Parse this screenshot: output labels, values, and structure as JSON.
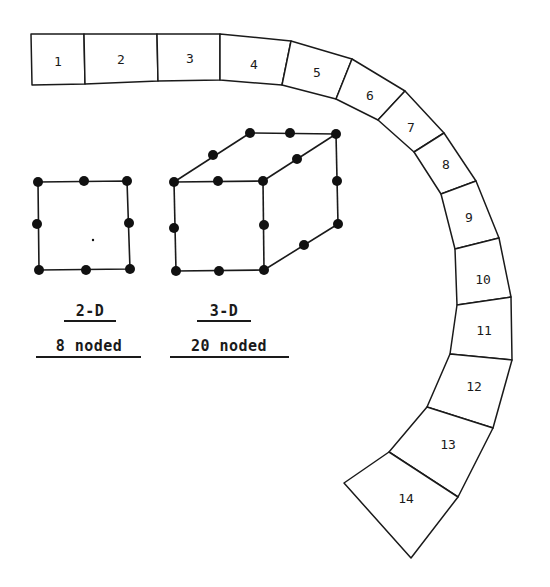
{
  "figure": {
    "background": "#ffffff",
    "ink_color": "#1a1a1a"
  },
  "mesh": {
    "description": "Curved strip of 14 finite elements",
    "elements": [
      {
        "id": "1",
        "label": "1",
        "quad": [
          [
            31,
            34
          ],
          [
            84,
            34
          ],
          [
            85,
            84
          ],
          [
            32,
            85
          ]
        ],
        "label_pos": [
          58,
          62
        ]
      },
      {
        "id": "2",
        "label": "2",
        "quad": [
          [
            84,
            34
          ],
          [
            157,
            34
          ],
          [
            158,
            81
          ],
          [
            85,
            84
          ]
        ],
        "label_pos": [
          121,
          60
        ]
      },
      {
        "id": "3",
        "label": "3",
        "quad": [
          [
            157,
            34
          ],
          [
            220,
            34
          ],
          [
            220,
            80
          ],
          [
            158,
            81
          ]
        ],
        "label_pos": [
          190,
          59
        ]
      },
      {
        "id": "4",
        "label": "4",
        "quad": [
          [
            220,
            34
          ],
          [
            291,
            41
          ],
          [
            282,
            85
          ],
          [
            220,
            80
          ]
        ],
        "label_pos": [
          254,
          65
        ]
      },
      {
        "id": "5",
        "label": "5",
        "quad": [
          [
            291,
            41
          ],
          [
            352,
            59
          ],
          [
            336,
            99
          ],
          [
            282,
            85
          ]
        ],
        "label_pos": [
          317,
          73
        ]
      },
      {
        "id": "6",
        "label": "6",
        "quad": [
          [
            352,
            59
          ],
          [
            405,
            91
          ],
          [
            378,
            120
          ],
          [
            336,
            99
          ]
        ],
        "label_pos": [
          370,
          96
        ]
      },
      {
        "id": "7",
        "label": "7",
        "quad": [
          [
            405,
            91
          ],
          [
            444,
            133
          ],
          [
            414,
            152
          ],
          [
            378,
            120
          ]
        ],
        "label_pos": [
          411,
          128
        ]
      },
      {
        "id": "8",
        "label": "8",
        "quad": [
          [
            444,
            133
          ],
          [
            476,
            181
          ],
          [
            441,
            194
          ],
          [
            414,
            152
          ]
        ],
        "label_pos": [
          446,
          165
        ]
      },
      {
        "id": "9",
        "label": "9",
        "quad": [
          [
            476,
            181
          ],
          [
            499,
            238
          ],
          [
            455,
            249
          ],
          [
            441,
            194
          ]
        ],
        "label_pos": [
          469,
          218
        ]
      },
      {
        "id": "10",
        "label": "10",
        "quad": [
          [
            499,
            238
          ],
          [
            511,
            297
          ],
          [
            457,
            305
          ],
          [
            455,
            249
          ]
        ],
        "label_pos": [
          483,
          280
        ]
      },
      {
        "id": "11",
        "label": "11",
        "quad": [
          [
            511,
            297
          ],
          [
            512,
            360
          ],
          [
            450,
            354
          ],
          [
            457,
            305
          ]
        ],
        "label_pos": [
          484,
          331
        ]
      },
      {
        "id": "12",
        "label": "12",
        "quad": [
          [
            512,
            360
          ],
          [
            493,
            428
          ],
          [
            427,
            407
          ],
          [
            450,
            354
          ]
        ],
        "label_pos": [
          474,
          387
        ]
      },
      {
        "id": "13",
        "label": "13",
        "quad": [
          [
            493,
            428
          ],
          [
            458,
            497
          ],
          [
            389,
            452
          ],
          [
            427,
            407
          ]
        ],
        "label_pos": [
          448,
          445
        ]
      },
      {
        "id": "14",
        "label": "14",
        "quad": [
          [
            458,
            497
          ],
          [
            411,
            558
          ],
          [
            344,
            483
          ],
          [
            389,
            452
          ]
        ],
        "label_pos": [
          406,
          499
        ]
      }
    ]
  },
  "element_2d": {
    "title": "2-D",
    "subtitle": "8 noded",
    "node_count": 8,
    "corners": [
      [
        38,
        182
      ],
      [
        127,
        181
      ],
      [
        130,
        269
      ],
      [
        39,
        270
      ]
    ],
    "nodes": [
      [
        38,
        182
      ],
      [
        84,
        181
      ],
      [
        127,
        181
      ],
      [
        129,
        223
      ],
      [
        130,
        269
      ],
      [
        86,
        270
      ],
      [
        39,
        270
      ],
      [
        37,
        224
      ]
    ],
    "center_dot": [
      93,
      240
    ]
  },
  "element_3d": {
    "title": "3-D",
    "subtitle": "20 noded",
    "node_count": 20,
    "edges": [
      [
        [
          174,
          182
        ],
        [
          263,
          181
        ]
      ],
      [
        [
          263,
          181
        ],
        [
          264,
          270
        ]
      ],
      [
        [
          264,
          270
        ],
        [
          176,
          271
        ]
      ],
      [
        [
          176,
          271
        ],
        [
          174,
          182
        ]
      ],
      [
        [
          174,
          182
        ],
        [
          250,
          133
        ]
      ],
      [
        [
          250,
          133
        ],
        [
          336,
          134
        ]
      ],
      [
        [
          336,
          134
        ],
        [
          263,
          181
        ]
      ],
      [
        [
          336,
          134
        ],
        [
          338,
          224
        ]
      ],
      [
        [
          338,
          224
        ],
        [
          264,
          270
        ]
      ]
    ],
    "nodes": [
      [
        174,
        182
      ],
      [
        218,
        181
      ],
      [
        263,
        181
      ],
      [
        174,
        228
      ],
      [
        264,
        225
      ],
      [
        176,
        271
      ],
      [
        219,
        271
      ],
      [
        264,
        270
      ],
      [
        250,
        133
      ],
      [
        290,
        133
      ],
      [
        336,
        134
      ],
      [
        213,
        155
      ],
      [
        297,
        159
      ],
      [
        337,
        181
      ],
      [
        338,
        224
      ],
      [
        304,
        245
      ]
    ]
  },
  "captions": {
    "col_2d": {
      "title": "2-D",
      "subtitle": "8 noded"
    },
    "col_3d": {
      "title": "3-D",
      "subtitle": "20 noded"
    }
  }
}
